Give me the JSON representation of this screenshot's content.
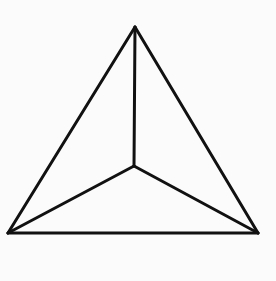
{
  "diagram": {
    "type": "triangular-pyramid-top-view",
    "background": "#fbfbfb",
    "stroke_color": "#111111",
    "stroke_width": 3,
    "vertices": {
      "apex": [
        135,
        27
      ],
      "bottom_left": [
        8,
        233
      ],
      "bottom_right": [
        258,
        233
      ],
      "center": [
        134,
        166
      ]
    },
    "edges": [
      [
        "apex",
        "bottom_left"
      ],
      [
        "apex",
        "bottom_right"
      ],
      [
        "bottom_left",
        "bottom_right"
      ],
      [
        "apex",
        "center"
      ],
      [
        "bottom_left",
        "center"
      ],
      [
        "bottom_right",
        "center"
      ]
    ]
  }
}
